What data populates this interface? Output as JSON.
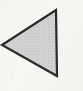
{
  "figure": {
    "name": "left-pointing-triangle",
    "alt_text": "Left-pointing triangle",
    "width": 83,
    "height": 91
  },
  "canvas": {
    "width": 83,
    "height": 91,
    "background_color": "#f7f6f3"
  },
  "shape": {
    "type": "triangle",
    "direction": "left",
    "points": "56,10 57,76 2,45",
    "apex_top": {
      "x": 56,
      "y": 10
    },
    "apex_bottom": {
      "x": 57,
      "y": 76
    },
    "apex_left": {
      "x": 2,
      "y": 45
    },
    "fill_color": "#d2d2d2",
    "stroke_color": "#2a2a2a",
    "stroke_width": 2.2,
    "dither_color": "#b8b8b8"
  }
}
